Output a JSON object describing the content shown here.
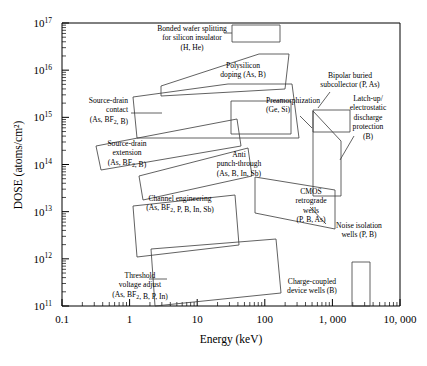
{
  "chart_data": {
    "type": "scatter",
    "title": "",
    "xlabel": "Energy (keV)",
    "ylabel": "DOSE (atoms/cm²)",
    "xscale": "log",
    "yscale": "log",
    "xlim": [
      0.1,
      10000
    ],
    "ylim": [
      100000000000.0,
      1e+17
    ],
    "grid": false,
    "legend": "none",
    "xtick_labels": [
      "0.1",
      "1",
      "10",
      "100",
      "1, 000",
      "10, 000"
    ],
    "xtick_values": [
      0.1,
      1,
      10,
      100,
      1000,
      10000
    ],
    "ytick_labels": [
      "10¹¹",
      "10¹²",
      "10¹³",
      "10¹⁴",
      "10¹⁵",
      "10¹⁶",
      "10¹⁷"
    ],
    "ytick_bases": [
      "10",
      "10",
      "10",
      "10",
      "10",
      "10",
      "10"
    ],
    "ytick_exponents": [
      "11",
      "12",
      "13",
      "14",
      "15",
      "16",
      "17"
    ],
    "ytick_values": [
      100000000000.0,
      1000000000000.0,
      10000000000000.0,
      100000000000000.0,
      1000000000000000.0,
      1e+16,
      1e+17
    ],
    "regions": [
      {
        "id": "bonded-wafer-splitting",
        "name": "Bonded wafer splitting for silicon insulator",
        "species": "(H, He)",
        "label_lines": [
          "Bonded wafer splitting",
          "for silicon insulator",
          "(H, He)"
        ],
        "label_x": 192,
        "label_y": 31,
        "label_anchor": "middle",
        "shape_points": "232,25 280,25 280,42 232,42",
        "leader": "224,33 232,33"
      },
      {
        "id": "polysilicon-doping",
        "name": "Polysilicon doping",
        "species": "(As, B)",
        "label_lines": [
          "Polysilicon",
          "doping (As, B)"
        ],
        "label_x": 243,
        "label_y": 68,
        "label_anchor": "middle",
        "shape_points": "161,86 259,54 289,54 285,89 161,96",
        "leader": ""
      },
      {
        "id": "source-drain-contact",
        "name": "Source-drain contact",
        "species": "(As, BF2, B)",
        "label_lines": [
          "Source-drain",
          "contact",
          "(As, BF₂, B)"
        ],
        "label_x": 128,
        "label_y": 103,
        "label_anchor": "end",
        "shape_points": "133,97 228,84 292,84 299,138 137,138",
        "leader": "131,113 162,113"
      },
      {
        "id": "source-drain-extension",
        "name": "Source-drain extension",
        "species": "(As, BF2, B)",
        "label_lines": [
          "Source-drain",
          "extension",
          "(As, BF₂, B)"
        ],
        "label_x": 127,
        "label_y": 146,
        "label_anchor": "middle",
        "shape_points": "96,146 237,119 241,146 101,170",
        "leader": ""
      },
      {
        "id": "preamorphization",
        "name": "Preamorphization",
        "species": "(Ge, Si)",
        "label_lines": [
          "Preamorphization",
          "(Ge, Si)"
        ],
        "label_x": 266,
        "label_y": 103,
        "label_anchor": "start",
        "shape_points": "231,101 291,101 291,134 231,134",
        "leader": "300,116 312,128"
      },
      {
        "id": "anti-punch-through",
        "name": "Anti punch-through",
        "species": "(As, B, In, Sb)",
        "label_lines": [
          "Anti",
          "punch-through",
          "(As, B, In, Sb)"
        ],
        "label_x": 239,
        "label_y": 157,
        "label_anchor": "middle",
        "shape_points": "139,176 248,148 252,176 143,200",
        "leader": ""
      },
      {
        "id": "bipolar-buried-subcollector",
        "name": "Bipolar buried subcollector",
        "species": "(P, As)",
        "label_lines": [
          "Bipolar buried",
          "subcollector (P, As)"
        ],
        "label_x": 350,
        "label_y": 78,
        "label_anchor": "middle",
        "shape_points": "313,110 350,110 350,132 313,132",
        "leader": "330,92 318,108"
      },
      {
        "id": "latch-up-esd-protection",
        "name": "Latch-up/electrostatic discharge protection",
        "species": "(B)",
        "label_lines": [
          "Latch-up/",
          "electrostatic",
          "discharge",
          "protection",
          "(B)"
        ],
        "label_x": 368,
        "label_y": 101,
        "label_anchor": "middle",
        "shape_points": "313,111 341,141 341,196 313,196",
        "leader": "354,136 340,160"
      },
      {
        "id": "cmos-retrograde-wells",
        "name": "CMOS retrograde wells",
        "species": "(P, B, As)",
        "label_lines": [
          "CMOS",
          "retrograde",
          "wells",
          "(P, B, As)"
        ],
        "label_x": 311,
        "label_y": 194,
        "label_anchor": "middle",
        "shape_points": "255,177 335,190 335,229 255,213",
        "leader": ""
      },
      {
        "id": "noise-isolation-wells",
        "name": "Noise isolation wells",
        "species": "(P, B)",
        "label_lines": [
          "Noise isolation",
          "wells (P, B)"
        ],
        "label_x": 359,
        "label_y": 228,
        "label_anchor": "middle",
        "shape_points": "",
        "leader": "326,224 310,207"
      },
      {
        "id": "channel-engineering",
        "name": "Channel engineering",
        "species": "(As, BF2, P, B, In, Sb)",
        "label_lines": [
          "Channel engineering",
          "(As, BF₂, P, B, In, Sb)"
        ],
        "label_x": 180,
        "label_y": 201,
        "label_anchor": "middle",
        "shape_points": "133,206 235,195 239,245 137,257",
        "leader": ""
      },
      {
        "id": "threshold-voltage-adjust",
        "name": "Threshold voltage adjust",
        "species": "(As, BF2, B, P, In)",
        "label_lines": [
          "Threshold",
          "voltage adjust",
          "(As, BF₂, B, P, In)"
        ],
        "label_x": 140,
        "label_y": 278,
        "label_anchor": "middle",
        "shape_points": "151,249 276,239 281,293 155,306",
        "leader": "149,279 167,279"
      },
      {
        "id": "charge-coupled-device-wells",
        "name": "Charge-coupled device wells",
        "species": "(B)",
        "label_lines": [
          "Charge-coupled",
          "device wells (B)"
        ],
        "label_x": 312,
        "label_y": 284,
        "label_anchor": "middle",
        "shape_points": "352,262 370,262 370,306 352,306",
        "leader": ""
      }
    ]
  },
  "plot": {
    "left": 62,
    "right": 400,
    "top": 23,
    "bottom": 306
  }
}
